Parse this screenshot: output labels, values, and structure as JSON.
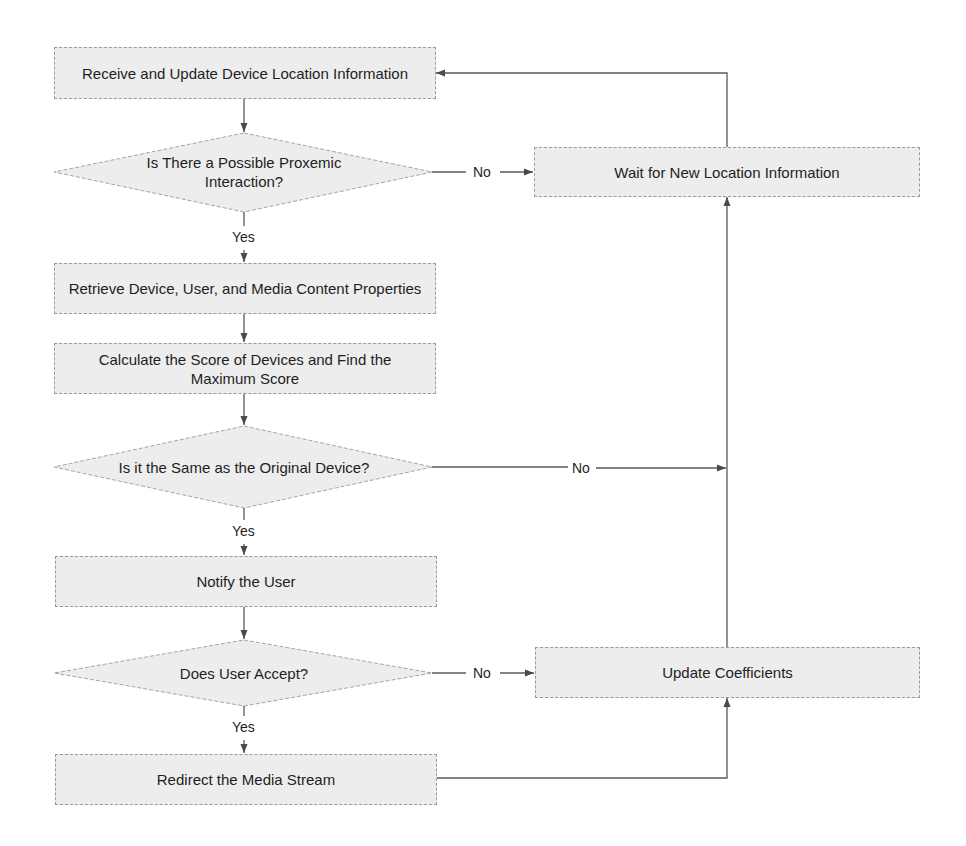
{
  "diagram": {
    "type": "flowchart",
    "nodes": {
      "receive": {
        "label": "Receive and Update Device Location Information",
        "shape": "process"
      },
      "proxemic": {
        "label": "Is There a Possible Proxemic Interaction?",
        "shape": "decision"
      },
      "wait": {
        "label": "Wait for New Location Information",
        "shape": "process"
      },
      "retrieve": {
        "label": "Retrieve Device, User, and Media Content Properties",
        "shape": "process"
      },
      "calculate": {
        "label": "Calculate the Score of Devices and Find the Maximum Score",
        "shape": "process"
      },
      "same_device": {
        "label": "Is it the Same as the Original Device?",
        "shape": "decision"
      },
      "notify": {
        "label": "Notify the User",
        "shape": "process"
      },
      "accept": {
        "label": "Does User Accept?",
        "shape": "decision"
      },
      "update": {
        "label": "Update Coefficients",
        "shape": "process"
      },
      "redirect": {
        "label": "Redirect the Media Stream",
        "shape": "process"
      }
    },
    "edges": {
      "proxemic_no": {
        "from": "proxemic",
        "to": "wait",
        "label": "No"
      },
      "proxemic_yes": {
        "from": "proxemic",
        "to": "retrieve",
        "label": "Yes"
      },
      "same_no": {
        "from": "same_device",
        "to": "wait",
        "label": "No"
      },
      "same_yes": {
        "from": "same_device",
        "to": "notify",
        "label": "Yes"
      },
      "accept_no": {
        "from": "accept",
        "to": "update",
        "label": "No"
      },
      "accept_yes": {
        "from": "accept",
        "to": "redirect",
        "label": "Yes"
      }
    },
    "colors": {
      "node_fill": "#ededed",
      "node_border": "#9a9a9a",
      "line": "#5a5a5a",
      "text": "#1e1e1e"
    }
  }
}
